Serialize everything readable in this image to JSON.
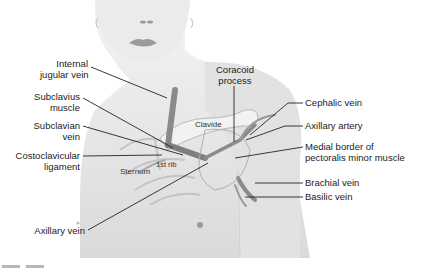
{
  "figure": {
    "type": "anatomical-diagram"
  },
  "labels_left": [
    {
      "line1": "Internal",
      "line2": "jugular vein"
    },
    {
      "line1": "Subclavius",
      "line2": "muscle"
    },
    {
      "line1": "Subclavian",
      "line2": "vein"
    },
    {
      "line1": "Costoclavicular",
      "line2": "ligament"
    },
    {
      "line1": "Axillary vein",
      "line2": ""
    }
  ],
  "labels_right": [
    {
      "line1": "Cephalic vein",
      "line2": ""
    },
    {
      "line1": "Axillary artery",
      "line2": ""
    },
    {
      "line1": "Medial border of",
      "line2": "pectoralis minor muscle"
    },
    {
      "line1": "Brachial vein",
      "line2": ""
    },
    {
      "line1": "Basilic vein",
      "line2": ""
    }
  ],
  "labels_top": [
    {
      "line1": "Coracoid",
      "line2": "process"
    }
  ],
  "labels_inner": {
    "clavicle": "Clavide",
    "sternum": "Sternum",
    "first_rib": "1st rib"
  },
  "colors": {
    "skin": "#e4e4e4",
    "skin_shadow": "#cfcfcf",
    "vein": "#8a8a8a",
    "vein_dark": "#6e6e6e",
    "bone": "#f2f2f2",
    "leader_line": "#222222",
    "lips": "#9c9c9c"
  }
}
